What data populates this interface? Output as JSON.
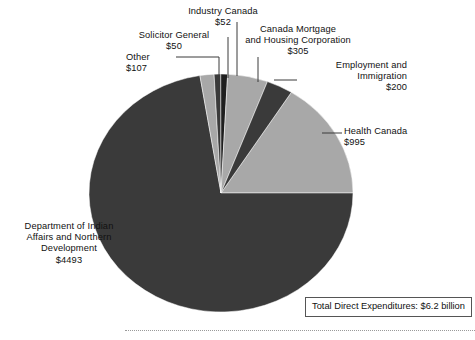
{
  "chart_data": {
    "type": "pie",
    "title": "",
    "subtitle": "",
    "unit": "millions of dollars",
    "total_label": "Total Direct Expenditures: $6.2 billion",
    "legend_position": "callout-labels",
    "grid": false,
    "start_angle_deg": 90,
    "direction": "clockwise",
    "categories": [
      "Health Canada",
      "Department of Indian Affairs and Northern Development",
      "Other",
      "Solicitor General",
      "Industry Canada",
      "Canada Mortgage and Housing Corporation",
      "Employment and Immigration"
    ],
    "values": [
      995,
      4493,
      107,
      50,
      52,
      305,
      200
    ],
    "slices": [
      {
        "name": "health-canada",
        "label": "Health Canada",
        "value": "$995",
        "amount": 995,
        "color": "#a8a8a8",
        "start_deg": 32.2,
        "sweep_deg": 57.8
      },
      {
        "name": "department-of-indian-affairs-and-northern-development",
        "label": "Department of Indian\nAffairs and Northern\nDevelopment",
        "value": "$4493",
        "amount": 4493,
        "color": "#3a3a3a",
        "start_deg": 90.0,
        "sweep_deg": 260.8
      },
      {
        "name": "other",
        "label": "Other",
        "value": "$107",
        "amount": 107,
        "color": "#a8a8a8",
        "start_deg": 350.8,
        "sweep_deg": 6.2
      },
      {
        "name": "solicitor-general",
        "label": "Solicitor General",
        "value": "$50",
        "amount": 50,
        "color": "#3a3a3a",
        "start_deg": 357.0,
        "sweep_deg": 2.9
      },
      {
        "name": "industry-canada",
        "label": "Industry Canada",
        "value": "$52",
        "amount": 52,
        "color": "#1f1f1f",
        "start_deg": 359.9,
        "sweep_deg": 3.0
      },
      {
        "name": "canada-mortgage-and-housing-corporation",
        "label": "Canada Mortgage\nand Housing Corporation",
        "value": "$305",
        "amount": 305,
        "color": "#a8a8a8",
        "start_deg": 2.9,
        "sweep_deg": 17.7
      },
      {
        "name": "employment-and-immigration",
        "label": "Employment and\nImmigration",
        "value": "$200",
        "amount": 200,
        "color": "#3a3a3a",
        "start_deg": 20.6,
        "sweep_deg": 11.6
      }
    ],
    "colors": {
      "dark": "#3a3a3a",
      "darkest": "#1f1f1f",
      "light": "#a8a8a8",
      "background": "#ffffff",
      "leader_line": "#3a3a3a",
      "footer_rule": "#9a9a9a",
      "box_border": "#555555"
    }
  },
  "labels": {
    "industry_canada": "Industry Canada\n$52",
    "solicitor_general": "Solicitor General\n$50",
    "other": "Other\n$107",
    "cmhc": "Canada Mortgage\nand Housing Corporation\n$305",
    "employment": "Employment and\nImmigration\n$200",
    "health_canada": "Health Canada\n$995",
    "diand": "Department of Indian\nAffairs and Northern\nDevelopment\n$4493"
  },
  "footnote": {
    "total_box": "Total Direct Expenditures: $6.2 billion"
  }
}
